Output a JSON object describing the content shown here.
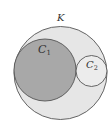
{
  "diagram": {
    "type": "nested-circles",
    "background": "#ffffff",
    "stroke_color": "#555555",
    "circles": [
      {
        "id": "K",
        "label": "K",
        "subscript": "",
        "cx": 60.5,
        "cy": 73,
        "r": 46.5,
        "fill": "#e6e6e6",
        "label_x": 57,
        "label_y": 21
      },
      {
        "id": "C1",
        "label": "C",
        "subscript": "1",
        "cx": 45,
        "cy": 70,
        "r": 31,
        "fill": "#a8a8a8",
        "label_x": 38,
        "label_y": 53
      },
      {
        "id": "C2",
        "label": "C",
        "subscript": "2",
        "cx": 91.5,
        "cy": 71,
        "r": 15.5,
        "fill": "#ececec",
        "label_x": 86,
        "label_y": 68
      }
    ]
  }
}
